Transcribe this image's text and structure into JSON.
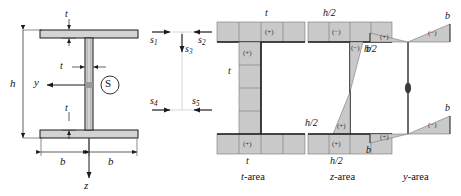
{
  "figure": {
    "colors": {
      "fill_gray": "#c9c9c9",
      "fill_gray_light": "#d4d4d4",
      "stroke_dark": "#1a1a1a",
      "stroke_mid": "#555555",
      "hairline": "#777777",
      "background": "#ffffff"
    }
  },
  "panel_section": {
    "name": "I-beam cross-section",
    "dim_flange_thickness_top": "t",
    "dim_web_thickness": "t",
    "dim_flange_thickness_bottom": "t",
    "dim_height": "h",
    "dim_width_left": "b",
    "dim_width_right": "b",
    "axis_y": "y",
    "axis_z": "z",
    "centroid_marker": "S"
  },
  "panel_shearflow": {
    "name": "shear flow arrows",
    "arrows": [
      {
        "id": "s1",
        "label": "s",
        "subscript": "1",
        "direction": "right"
      },
      {
        "id": "s2",
        "label": "s",
        "subscript": "2",
        "direction": "left"
      },
      {
        "id": "s3",
        "label": "s",
        "subscript": "3",
        "direction": "down"
      },
      {
        "id": "s4",
        "label": "s",
        "subscript": "4",
        "direction": "right"
      },
      {
        "id": "s5",
        "label": "s",
        "subscript": "5",
        "direction": "left"
      }
    ]
  },
  "panel_t_area": {
    "caption_italic": "t",
    "caption_rest": "-area",
    "label_top": "t",
    "label_web": "t",
    "label_bottom": "t",
    "sign_top_flange": "(+)",
    "sign_web": "(+)",
    "sign_bottom_flange": "(+)"
  },
  "panel_z_area": {
    "caption_italic": "z",
    "caption_rest": "-area",
    "label_top": "h/2",
    "label_web_upper": "h/2",
    "label_web_lower": "h/2",
    "label_bottom": "h/2",
    "sign_top_flange": "(−)",
    "sign_web_upper": "(−)",
    "sign_web_lower": "(+)",
    "sign_bottom_flange": "(+)"
  },
  "panel_y_area": {
    "caption_italic": "y",
    "caption_rest": "-area",
    "label_top_right": "b",
    "label_top_left": "b",
    "label_bottom_left": "b",
    "label_bottom_right": "b",
    "sign_top_left": "(+)",
    "sign_top_right": "(−)",
    "sign_bottom_left": "(+)",
    "sign_bottom_right": "(−)",
    "web_value": "0"
  }
}
